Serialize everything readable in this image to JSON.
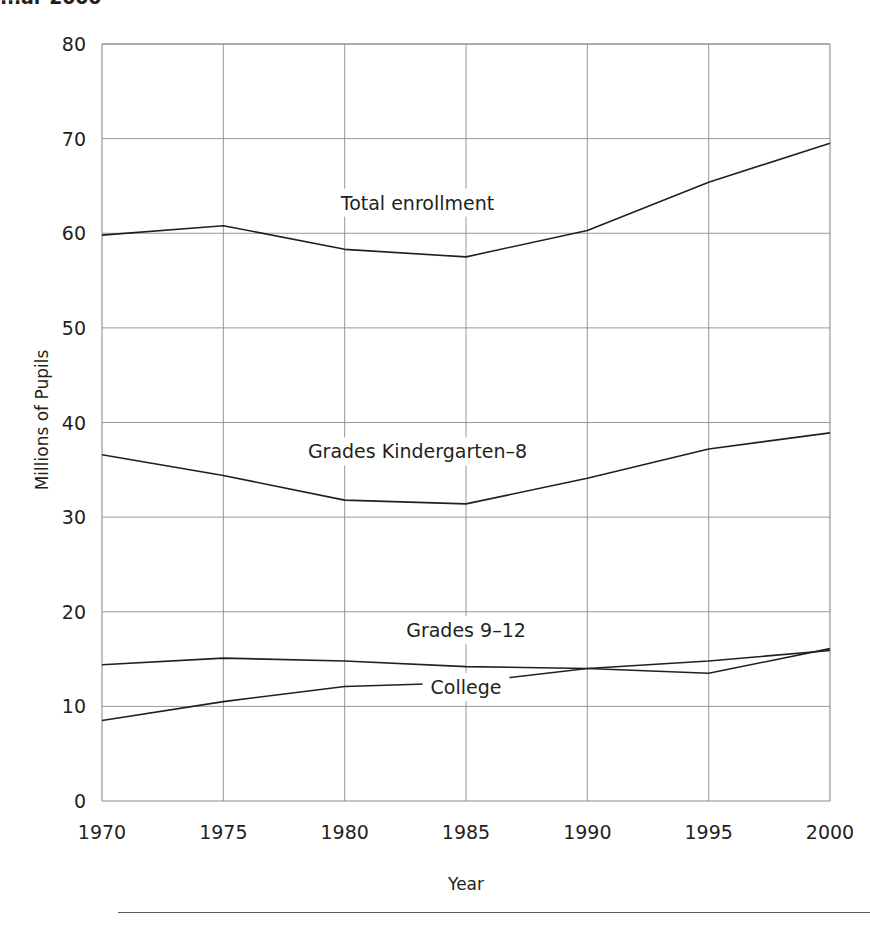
{
  "title": "...ar 2000",
  "chart_data": {
    "type": "line",
    "title": "",
    "xlabel": "Year",
    "ylabel": "Millions of Pupils",
    "x": [
      1970,
      1975,
      1980,
      1985,
      1990,
      1995,
      2000
    ],
    "xticklabels": [
      "1970",
      "1975",
      "1980",
      "1985",
      "1990",
      "1995",
      "2000"
    ],
    "yticks": [
      0,
      10,
      20,
      30,
      40,
      50,
      60,
      70,
      80
    ],
    "yticklabels": [
      "0",
      "10",
      "20",
      "30",
      "40",
      "50",
      "60",
      "70",
      "80"
    ],
    "xlim": [
      1970,
      2000
    ],
    "ylim": [
      0,
      80
    ],
    "grid": true,
    "legend_position": "inline-labels",
    "line_color": "#231f20",
    "grid_color": "#8c8c8c",
    "series": [
      {
        "name": "Total enrollment",
        "values": [
          59.8,
          60.8,
          58.3,
          57.5,
          60.3,
          65.4,
          69.5
        ],
        "label_x": 1983,
        "label_y": 62.5
      },
      {
        "name": "Grades Kindergarten–8",
        "values": [
          36.6,
          34.4,
          31.8,
          31.4,
          34.1,
          37.2,
          38.9
        ],
        "label_x": 1983,
        "label_y": 36.2
      },
      {
        "name": "Grades 9–12",
        "values": [
          14.4,
          15.1,
          14.8,
          14.2,
          14.0,
          13.5,
          16.1
        ],
        "label_x": 1985,
        "label_y": 17.3
      },
      {
        "name": "College",
        "values": [
          8.5,
          10.5,
          12.1,
          12.5,
          14.0,
          14.8,
          15.9
        ],
        "label_x": 1985,
        "label_y": 11.3
      }
    ]
  }
}
